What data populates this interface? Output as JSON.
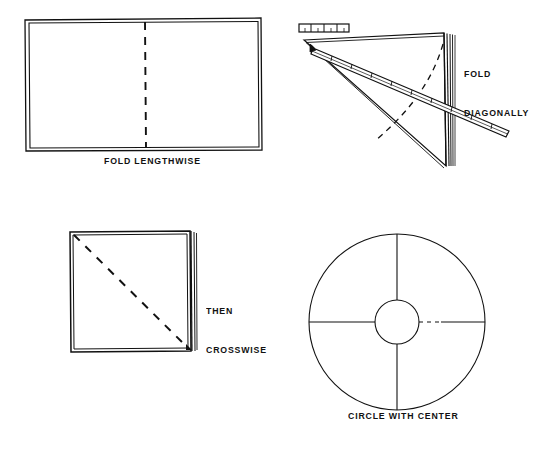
{
  "figure": {
    "background_color": "#ffffff",
    "ink_color": "#111111",
    "width": 538,
    "height": 455
  },
  "panels": [
    {
      "id": "panel-fold-lengthwise",
      "caption": "FOLD LENGTHWISE",
      "shape": "rectangle",
      "description": "Flat rectangular sheet of paper with a vertical dashed fold line down the middle"
    },
    {
      "id": "panel-fold-diagonally",
      "caption_line1": "FOLD",
      "caption_line2": "DIAGONALLY",
      "shape": "folded-triangle",
      "description": "Folded paper forming a right triangle with layered edges, a ruler laid across it, and a dashed arc"
    },
    {
      "id": "panel-then-crosswise",
      "caption_line1": "THEN",
      "caption_line2": "CROSSWISE",
      "shape": "square",
      "description": "Square folded packet with a dashed diagonal from top-left to bottom-right and layered edges at right"
    },
    {
      "id": "panel-circle-with-center",
      "caption": "CIRCLE WITH CENTER",
      "shape": "circle",
      "description": "Large circle with small concentric inner circle and four radial crease lines; right radius partly dashed"
    }
  ],
  "captions": {
    "fold_lengthwise": "FOLD LENGTHWISE",
    "fold": "FOLD",
    "diagonally": "DIAGONALLY",
    "then": "THEN",
    "crosswise": "CROSSWISE",
    "circle_with_center": "CIRCLE WITH CENTER"
  }
}
